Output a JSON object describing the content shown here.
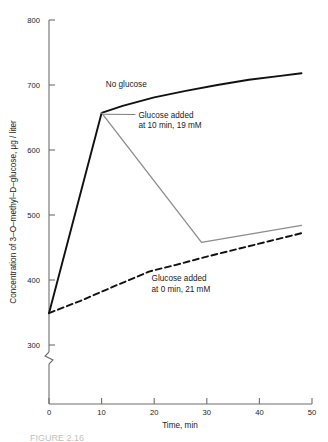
{
  "figure": {
    "caption_partial": "FIGURE 2.16"
  },
  "chart_data": {
    "type": "line",
    "title": "",
    "xlabel": "Time, min",
    "ylabel": "Concentration of 3–O–methyl–D–glucose, μg / liter",
    "xlim": [
      0,
      50
    ],
    "ylim": [
      300,
      800
    ],
    "y_axis_break": true,
    "y_axis_break_note": "axis broken below 300",
    "xticks": [
      0,
      10,
      20,
      30,
      40,
      50
    ],
    "xticklabels": [
      "0",
      "10",
      "20",
      "30",
      "40",
      "50"
    ],
    "yticks": [
      300,
      400,
      500,
      600,
      700,
      800
    ],
    "yticklabels": [
      "300",
      "400",
      "500",
      "600",
      "700",
      "800"
    ],
    "grid": false,
    "legend": "none-inline-annotations",
    "series": [
      {
        "name": "No glucose",
        "style": "solid",
        "color": "#111111",
        "width": 1.9,
        "x": [
          0,
          10,
          14,
          20,
          26,
          32,
          38,
          44,
          48
        ],
        "y": [
          349,
          657,
          668,
          681,
          691,
          700,
          708,
          714,
          718
        ]
      },
      {
        "name": "Glucose added at 10 min, 19 mM",
        "style": "solid",
        "color": "#8c8c8c",
        "width": 1.3,
        "x": [
          10,
          29,
          48
        ],
        "y": [
          657,
          458,
          484
        ]
      },
      {
        "name": "Glucose added at 0 min, 21 mM",
        "style": "dashed",
        "color": "#111111",
        "width": 1.9,
        "x": [
          0,
          6,
          12,
          17,
          19,
          24,
          30,
          36,
          42,
          48
        ],
        "y": [
          349,
          368,
          389,
          406,
          413,
          423,
          436,
          448,
          460,
          472
        ]
      }
    ],
    "annotations": [
      {
        "id": "no-glucose",
        "lines": [
          "No glucose"
        ],
        "x": 10.8,
        "y": 697,
        "leader": false
      },
      {
        "id": "glucose-10min",
        "lines": [
          "Glucose added",
          "at 10 min, 19 mM"
        ],
        "x": 17.0,
        "y": 650,
        "leader": true,
        "leader_to_x": 10.4,
        "leader_to_y": 655
      },
      {
        "id": "glucose-0min",
        "lines": [
          "Glucose added",
          "at 0 min, 21 mM"
        ],
        "x": 19.5,
        "y": 398,
        "leader": false
      }
    ]
  },
  "colors": {
    "axis": "#6e6e6e",
    "series_solid": "#111111",
    "series_gray": "#8c8c8c",
    "text": "#1a1a1a",
    "background": "#ffffff"
  }
}
